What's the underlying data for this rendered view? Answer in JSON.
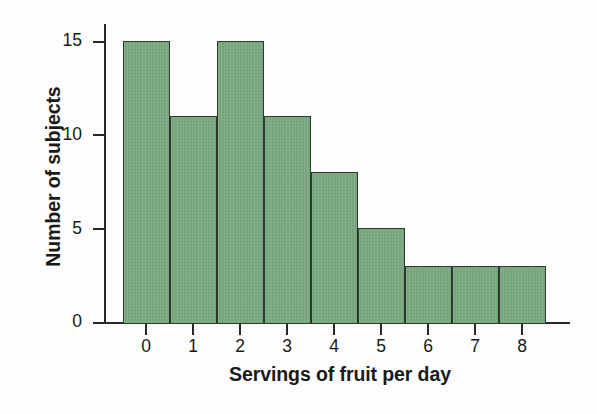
{
  "chart_data": {
    "type": "bar",
    "title": "",
    "subtitle": "",
    "xlabel": "Servings of fruit per day",
    "ylabel": "Number of subjects",
    "categories": [
      "0",
      "1",
      "2",
      "3",
      "4",
      "5",
      "6",
      "7",
      "8"
    ],
    "values": [
      15,
      11,
      15,
      11,
      8,
      5,
      3,
      3,
      3
    ],
    "series": [
      {
        "name": "Number of subjects",
        "values": [
          15,
          11,
          15,
          11,
          8,
          5,
          3,
          3,
          3
        ]
      }
    ],
    "xlim": [
      -0.5,
      8.5
    ],
    "ylim": [
      0,
      16
    ],
    "x_tick_labels": [
      "0",
      "1",
      "2",
      "3",
      "4",
      "5",
      "6",
      "7",
      "8"
    ],
    "y_tick_labels": [
      "0",
      "5",
      "10",
      "15"
    ],
    "y_ticks": [
      0,
      5,
      10,
      15
    ],
    "grid": false,
    "legend": false,
    "legend_position": "none",
    "bar_fill_color": "#79a880",
    "bar_edge_color": "#2b3a2e",
    "axis_color": "#26282a",
    "text_color": "#1a1a1a",
    "background_color": "#fdfdfd",
    "annotations": []
  }
}
